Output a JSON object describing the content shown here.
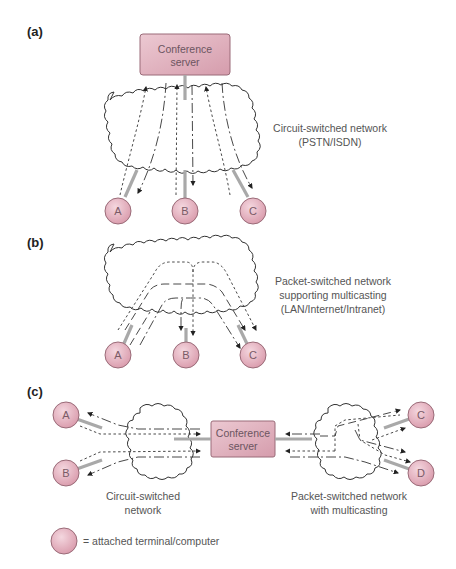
{
  "panels": {
    "a": {
      "label": "(a)",
      "server_line1": "Conference",
      "server_line2": "server",
      "network_line1": "Circuit-switched network",
      "network_line2": "(PSTN/ISDN)",
      "nodes": [
        "A",
        "B",
        "C"
      ]
    },
    "b": {
      "label": "(b)",
      "network_line1": "Packet-switched network",
      "network_line2": "supporting multicasting",
      "network_line3": "(LAN/Internet/Intranet)",
      "nodes": [
        "A",
        "B",
        "C"
      ]
    },
    "c": {
      "label": "(c)",
      "server_line1": "Conference",
      "server_line2": "server",
      "left_network_line1": "Circuit-switched",
      "left_network_line2": "network",
      "right_network_line1": "Packet-switched network",
      "right_network_line2": "with multicasting",
      "nodes": [
        "A",
        "B",
        "C",
        "D"
      ]
    }
  },
  "legend": {
    "text": "= attached terminal/computer"
  },
  "colors": {
    "node_fill": "#e8b9c6",
    "node_stroke": "#9a6b78",
    "server_fill": "#dcaab7",
    "server_stroke": "#9a6b78",
    "link": "#a9a9a9"
  }
}
